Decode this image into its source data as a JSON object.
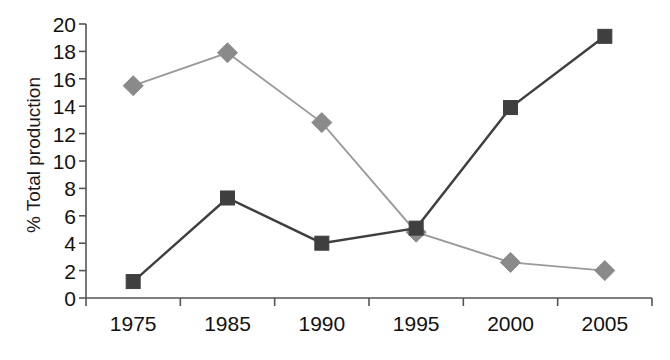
{
  "chart_data": {
    "type": "line",
    "title": "",
    "xlabel": "",
    "ylabel": "% Total production",
    "categories": [
      "1975",
      "1985",
      "1990",
      "1995",
      "2000",
      "2005"
    ],
    "ylim": [
      0,
      20
    ],
    "yticks": [
      0,
      2,
      4,
      6,
      8,
      10,
      12,
      14,
      16,
      18,
      20
    ],
    "ytick_labels": [
      "0",
      "2",
      "4",
      "6",
      "8",
      "10",
      "12",
      "14",
      "16",
      "18",
      "20"
    ],
    "grid": false,
    "legend": "none",
    "series": [
      {
        "name": "diamond-series",
        "marker": "diamond",
        "color": "#8a8a8a",
        "line_color": "#9a9a9a",
        "values": [
          15.5,
          17.9,
          12.8,
          4.8,
          2.6,
          2.0
        ]
      },
      {
        "name": "square-series",
        "marker": "square",
        "color": "#3f3f3f",
        "line_color": "#3f3f3f",
        "values": [
          1.2,
          7.3,
          4.0,
          5.1,
          13.9,
          19.1
        ]
      }
    ]
  },
  "axis": {
    "y_label_text": "% Total production"
  }
}
